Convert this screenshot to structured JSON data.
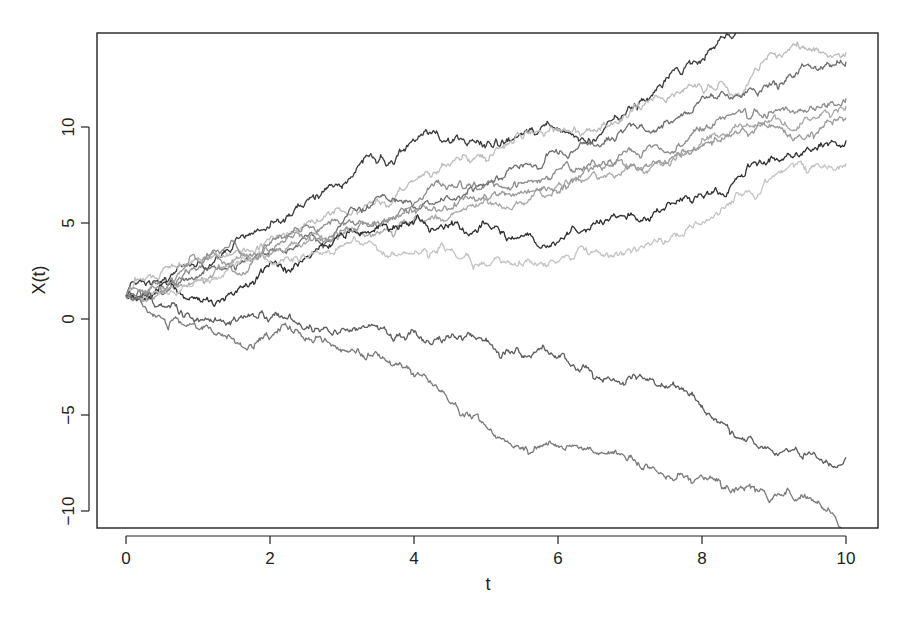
{
  "chart_data": {
    "type": "line",
    "title": "",
    "xlabel": "t",
    "ylabel": "X(t)",
    "xlim": [
      -0.4,
      10.4
    ],
    "ylim": [
      -10.9,
      14.9
    ],
    "x_ticks": [
      0,
      2,
      4,
      6,
      8,
      10
    ],
    "x_tick_labels": [
      "0",
      "2",
      "4",
      "6",
      "8",
      "10"
    ],
    "y_ticks": [
      -10,
      -5,
      0,
      5,
      10
    ],
    "y_tick_labels": [
      "-10",
      "-5",
      "0",
      "5",
      "10"
    ],
    "grid": false,
    "legend": null,
    "x": [
      0,
      1,
      2,
      3,
      4,
      5,
      6,
      7,
      8,
      9,
      10
    ],
    "series": [
      {
        "name": "path-1",
        "color": "#3a3a3a",
        "values": [
          1.2,
          3.0,
          4.8,
          6.8,
          9.3,
          9.0,
          9.8,
          11.0,
          13.5,
          16.0,
          18.0
        ]
      },
      {
        "name": "path-2",
        "color": "#bdbdbd",
        "values": [
          1.2,
          3.2,
          4.2,
          5.6,
          7.2,
          8.2,
          9.8,
          10.8,
          12.0,
          13.8,
          13.9
        ]
      },
      {
        "name": "path-3",
        "color": "#6e6e6e",
        "values": [
          1.2,
          2.2,
          3.6,
          5.0,
          5.8,
          7.0,
          8.6,
          10.2,
          11.6,
          12.4,
          13.4
        ]
      },
      {
        "name": "path-4",
        "color": "#8c8c8c",
        "values": [
          1.2,
          2.6,
          4.0,
          5.0,
          6.0,
          7.0,
          7.8,
          8.8,
          9.8,
          10.8,
          11.5
        ]
      },
      {
        "name": "path-5",
        "color": "#a8a8a8",
        "values": [
          1.2,
          2.0,
          3.4,
          4.4,
          5.2,
          6.2,
          7.0,
          8.0,
          9.4,
          10.6,
          11.1
        ]
      },
      {
        "name": "path-6",
        "color": "#2e2e2e",
        "values": [
          1.2,
          1.0,
          3.0,
          4.4,
          5.0,
          5.0,
          4.0,
          5.4,
          6.4,
          8.4,
          9.3
        ]
      },
      {
        "name": "path-7",
        "color": "#c4c4c4",
        "values": [
          1.2,
          2.0,
          3.0,
          3.8,
          3.4,
          2.8,
          3.0,
          3.6,
          5.0,
          7.4,
          8.1
        ]
      },
      {
        "name": "path-8",
        "color": "#9a9a9a",
        "values": [
          1.2,
          3.0,
          3.6,
          4.6,
          5.6,
          6.4,
          6.6,
          8.0,
          9.0,
          10.0,
          10.5
        ]
      },
      {
        "name": "path-9",
        "color": "#5c5c5c",
        "values": [
          1.2,
          0.0,
          0.0,
          -0.5,
          -0.7,
          -1.0,
          -2.0,
          -3.0,
          -4.5,
          -7.0,
          -7.2
        ]
      },
      {
        "name": "path-10",
        "color": "#7a7a7a",
        "values": [
          1.2,
          -0.5,
          -1.0,
          -1.6,
          -3.0,
          -5.6,
          -6.6,
          -7.2,
          -8.2,
          -9.2,
          -10.9
        ]
      }
    ]
  },
  "layout": {
    "plot_left": 97,
    "plot_right": 878,
    "plot_top": 33,
    "plot_bottom": 528,
    "x0_px": 126,
    "x_px_per_unit": 72,
    "y0_px": 319,
    "y_px_per_unit": 19.2
  }
}
